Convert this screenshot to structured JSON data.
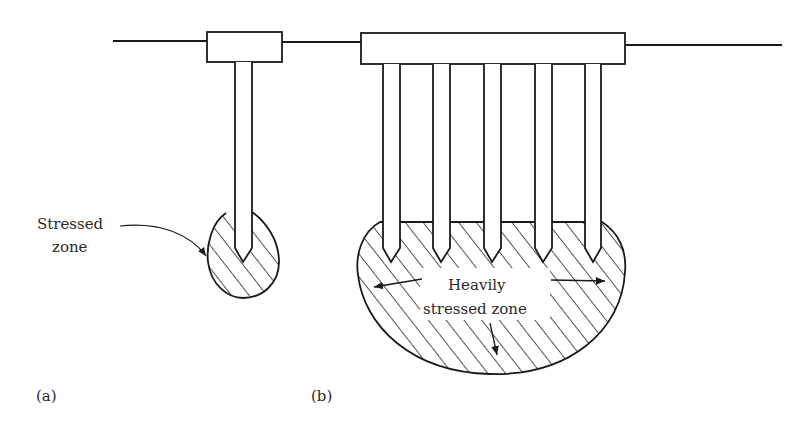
{
  "figure": {
    "panel_a": {
      "label": "(a)",
      "annotation_line1": "Stressed",
      "annotation_line2": "zone"
    },
    "panel_b": {
      "label": "(b)",
      "annotation_line1": "Heavily",
      "annotation_line2": "stressed zone"
    }
  },
  "colors": {
    "ink": "#1a1a1a",
    "background": "#ffffff"
  }
}
